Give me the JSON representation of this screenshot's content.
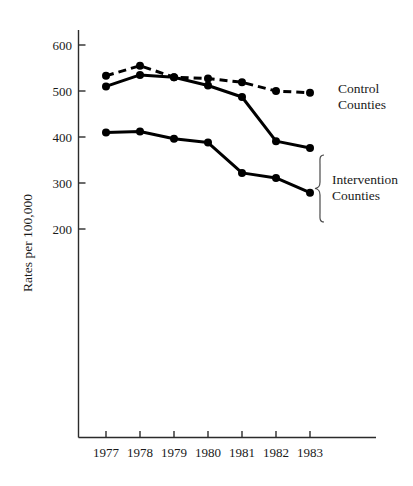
{
  "chart_data": {
    "type": "line",
    "title": "",
    "subtitle": "",
    "xlabel": "",
    "ylabel": "Rates per 100,000",
    "x": [
      1977,
      1978,
      1979,
      1980,
      1981,
      1982,
      1983
    ],
    "xtick_labels": [
      "1977",
      "1978",
      "1979",
      "1980",
      "1981",
      "1982",
      "1983"
    ],
    "ytick_labels": [
      "600",
      "500",
      "400",
      "300",
      "200"
    ],
    "ytick_values": [
      600,
      500,
      400,
      300,
      200
    ],
    "ylim": [
      100,
      640
    ],
    "xlim": [
      1976.6,
      1983.9
    ],
    "grid": false,
    "legend_position": "right-inline",
    "series": [
      {
        "name": "Control Counties",
        "style": "dashed",
        "marker": "filled-circle",
        "color": "#000000",
        "values": [
          533,
          555,
          530,
          527,
          519,
          500,
          496
        ]
      },
      {
        "name": "Intervention Counties (upper)",
        "style": "solid",
        "marker": "filled-circle",
        "color": "#000000",
        "values": [
          510,
          535,
          530,
          512,
          487,
          391,
          376
        ]
      },
      {
        "name": "Intervention Counties (lower)",
        "style": "solid",
        "marker": "filled-circle",
        "color": "#000000",
        "values": [
          410,
          412,
          396,
          388,
          322,
          311,
          279
        ]
      }
    ],
    "annotations": [
      {
        "id": "control-annotation",
        "text_line1": "Control",
        "text_line2": "Counties",
        "target_series": "Control Counties"
      },
      {
        "id": "intervention-annotation",
        "text_line1": "Intervention",
        "text_line2": "Counties",
        "target_series": "Intervention Counties",
        "bracket": true
      }
    ]
  },
  "axis": {
    "y_title": "Rates per 100,000",
    "y_ticks": [
      "600",
      "500",
      "400",
      "300",
      "200"
    ],
    "x_ticks": [
      "1977",
      "1978",
      "1979",
      "1980",
      "1981",
      "1982",
      "1983"
    ]
  },
  "legend": {
    "control_line1": "Control",
    "control_line2": "Counties",
    "intervention_line1": "Intervention",
    "intervention_line2": "Counties"
  },
  "colors": {
    "ink": "#000000",
    "axis": "#2b2b2b",
    "brace": "#4a4a4a",
    "background": "#ffffff"
  }
}
